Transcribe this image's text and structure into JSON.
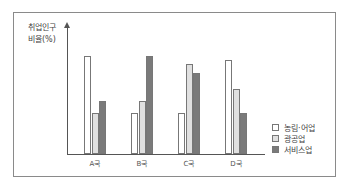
{
  "chart_data": {
    "type": "bar",
    "title": "",
    "xlabel": "",
    "ylabel": "취업인구 비율(%)",
    "ylabel_lines": [
      "취업인구",
      "비율(%)"
    ],
    "categories": [
      "A국",
      "B국",
      "C국",
      "D국"
    ],
    "series": [
      {
        "name": "농림·어업",
        "color": "#ffffff",
        "values": [
          98,
          41,
          41,
          94
        ]
      },
      {
        "name": "광공업",
        "color": "#e0e0e0",
        "values": [
          41,
          53,
          90,
          65
        ]
      },
      {
        "name": "서비스업",
        "color": "#7a7a7a",
        "values": [
          53,
          98,
          81,
          41
        ]
      }
    ],
    "legend_position": "right-bottom",
    "grid": false,
    "y_ticks": false
  }
}
